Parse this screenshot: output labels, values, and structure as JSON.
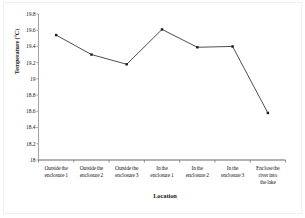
{
  "chart_data": {
    "type": "line",
    "title": "",
    "xlabel": "Location",
    "ylabel": "Temperature (°C)",
    "ylim": [
      18,
      19.8
    ],
    "ytick_step": 0.2,
    "grid": false,
    "legend": "none",
    "marker": "square",
    "line_color": "#3a3a3a",
    "marker_color": "#1a1a1a",
    "axis_color": "#808080",
    "categories": [
      "Outside the enclosure 1",
      "Outside the enclosure 2",
      "Outside the enclosure 3",
      "In the enclosure 1",
      "In the enclosure 2",
      "In the enclosure 3",
      "Enclose the river into the lake"
    ],
    "values": [
      19.54,
      19.3,
      19.18,
      19.61,
      19.39,
      19.4,
      18.58
    ],
    "ytick_labels": [
      "19.8",
      "19.6",
      "19.4",
      "19.2",
      "19",
      "18.8",
      "18.6",
      "18.4",
      "18.2",
      "18"
    ],
    "ytick_values": [
      19.8,
      19.6,
      19.4,
      19.2,
      19.0,
      18.8,
      18.6,
      18.4,
      18.2,
      18.0
    ],
    "xtick_lines": [
      [
        "Outside the",
        "enclosure 1"
      ],
      [
        "Outside the",
        "enclosure 2"
      ],
      [
        "Outside the",
        "enclosure 3"
      ],
      [
        "In the",
        "enclosure 1"
      ],
      [
        "In the",
        "enclosure 2"
      ],
      [
        "In the",
        "enclosure 3"
      ],
      [
        "Enclose the",
        "river into",
        "the lake"
      ]
    ]
  }
}
